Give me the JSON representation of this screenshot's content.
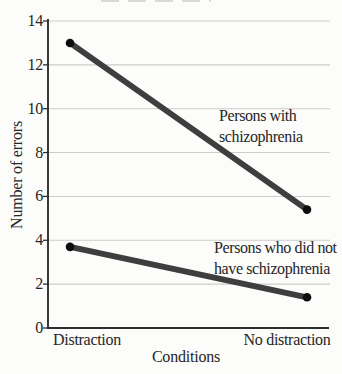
{
  "chart_data": {
    "type": "line",
    "title": "",
    "xlabel": "Conditions",
    "ylabel": "Number of errors",
    "categories": [
      "Distraction",
      "No distraction"
    ],
    "ylim": [
      0,
      14
    ],
    "yticks": [
      0,
      2,
      4,
      6,
      8,
      10,
      12,
      14
    ],
    "grid": "horizontal",
    "legend": "none-direct-labels",
    "series": [
      {
        "name": "Persons with schizophrenia",
        "values": [
          13.0,
          5.4
        ]
      },
      {
        "name": "Persons who did not have schizophrenia",
        "values": [
          3.7,
          1.4
        ]
      }
    ],
    "annotations": [
      {
        "text_lines": [
          "Persons with",
          "schizophrenia"
        ]
      },
      {
        "text_lines": [
          "Persons who did not",
          "have schizophrenia"
        ]
      }
    ],
    "colors": {
      "line": "#3e3e3e",
      "point": "#0d0d0d",
      "grid": "#cccccb",
      "axis": "#2e2e2e",
      "text": "#262626",
      "background": "#fcfcfa"
    }
  }
}
